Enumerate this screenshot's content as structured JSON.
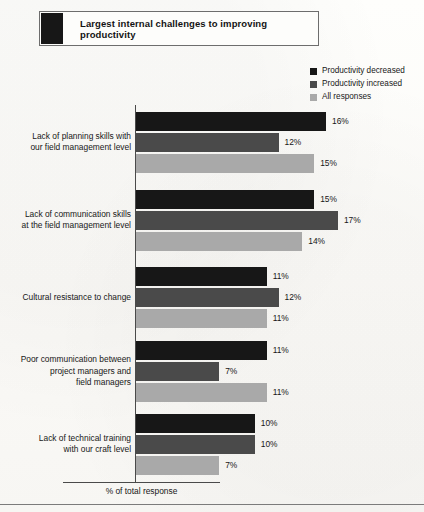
{
  "title": {
    "text": "Largest internal challenges to improving productivity",
    "swatch_color": "#171717"
  },
  "legend": {
    "items": [
      {
        "label": "Productivity decreased",
        "color": "#171717"
      },
      {
        "label": "Productivity increased",
        "color": "#4a4a4a"
      },
      {
        "label": "All responses",
        "color": "#a9a9a9"
      }
    ]
  },
  "axis": {
    "x_label": "% of total response"
  },
  "chart_data": {
    "type": "bar",
    "orientation": "horizontal",
    "title": "Largest internal challenges to improving productivity",
    "xlabel": "% of total response",
    "ylabel": "",
    "grid": false,
    "legend_position": "top-right",
    "value_suffix": "%",
    "xlim": [
      0,
      18
    ],
    "categories": [
      "Lack of planning skills with our field management level",
      "Lack of communication skills at the field management level",
      "Cultural resistance to change",
      "Poor communication between project managers and field managers",
      "Lack of technical training with our craft level"
    ],
    "category_lines": [
      [
        "Lack of planning skills with",
        "our field management level"
      ],
      [
        "Lack of communication skills",
        "at the field management level"
      ],
      [
        "Cultural resistance to change"
      ],
      [
        "Poor communication between",
        "project managers and",
        "field managers"
      ],
      [
        "Lack of technical training",
        "with our craft level"
      ]
    ],
    "series": [
      {
        "name": "Productivity decreased",
        "color": "#171717",
        "values": [
          16,
          15,
          11,
          11,
          10
        ],
        "labels": [
          "16%",
          "15%",
          "11%",
          "11%",
          "10%"
        ]
      },
      {
        "name": "Productivity increased",
        "color": "#4a4a4a",
        "values": [
          12,
          17,
          12,
          7,
          10
        ],
        "labels": [
          "12%",
          "17%",
          "12%",
          "7%",
          "10%"
        ]
      },
      {
        "name": "All responses",
        "color": "#a9a9a9",
        "values": [
          15,
          14,
          11,
          11,
          7
        ],
        "labels": [
          "15%",
          "14%",
          "11%",
          "11%",
          "7%"
        ]
      }
    ]
  }
}
